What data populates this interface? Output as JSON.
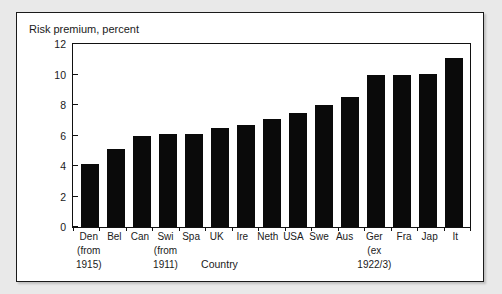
{
  "chart_data": {
    "type": "bar",
    "title": "Risk premium, percent",
    "xlabel": "Country",
    "ylabel": "",
    "ylim": [
      0,
      12
    ],
    "yticks": [
      0,
      2,
      4,
      6,
      8,
      10,
      12
    ],
    "grid": false,
    "legend": null,
    "bar_color": "#0a0a0a",
    "categories": [
      "Den (from 1915)",
      "Bel",
      "Can",
      "Swi (from 1911)",
      "Spa",
      "UK",
      "Ire",
      "Neth",
      "USA",
      "Swe",
      "Aus",
      "Ger (ex 1922/3)",
      "Fra",
      "Jap",
      "It"
    ],
    "values": [
      4.1,
      5.1,
      6.0,
      6.1,
      6.1,
      6.5,
      6.7,
      7.1,
      7.5,
      8.0,
      8.5,
      10.0,
      10.0,
      10.05,
      11.1
    ],
    "category_labels": [
      {
        "l1": "Den",
        "l2": "(from",
        "l3": "1915)"
      },
      {
        "l1": "Bel",
        "l2": "",
        "l3": ""
      },
      {
        "l1": "Can",
        "l2": "",
        "l3": ""
      },
      {
        "l1": "Swi",
        "l2": "(from",
        "l3": "1911)"
      },
      {
        "l1": "Spa",
        "l2": "",
        "l3": ""
      },
      {
        "l1": "UK",
        "l2": "",
        "l3": ""
      },
      {
        "l1": "Ire",
        "l2": "",
        "l3": ""
      },
      {
        "l1": "Neth",
        "l2": "",
        "l3": ""
      },
      {
        "l1": "USA",
        "l2": "",
        "l3": ""
      },
      {
        "l1": "Swe",
        "l2": "",
        "l3": ""
      },
      {
        "l1": "Aus",
        "l2": "",
        "l3": ""
      },
      {
        "l1": "Ger",
        "l2": "(ex",
        "l3": "1922/3)"
      },
      {
        "l1": "Fra",
        "l2": "",
        "l3": ""
      },
      {
        "l1": "Jap",
        "l2": "",
        "l3": ""
      },
      {
        "l1": "It",
        "l2": "",
        "l3": ""
      }
    ]
  }
}
